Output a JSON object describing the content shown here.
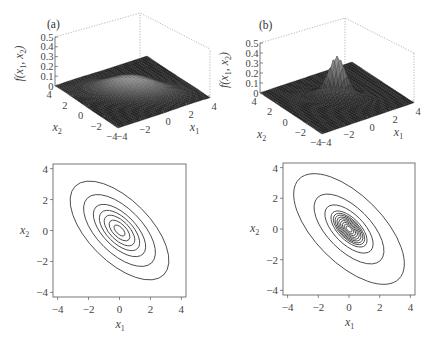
{
  "chart_data": [
    {
      "panel": "(a)",
      "type": "surface3d",
      "title": "",
      "zlabel": "f(x1, x2)",
      "xlabel": "x1",
      "ylabel": "x2",
      "z_ticks": [
        "0",
        "0.1",
        "0.2",
        "0.3",
        "0.4",
        "0.5"
      ],
      "x1_ticks": [
        "-4",
        "-2",
        "0",
        "2",
        "4"
      ],
      "x2_ticks": [
        "4",
        "2",
        "0",
        "-2",
        "-4"
      ],
      "xlim": [
        -4,
        4
      ],
      "ylim": [
        -4,
        4
      ],
      "zlim": [
        0,
        0.5
      ],
      "peak_value": 0.16,
      "description": "Broad bivariate Gaussian with negative correlation"
    },
    {
      "panel": "(b)",
      "type": "surface3d",
      "title": "",
      "zlabel": "f(x1, x2)",
      "xlabel": "x1",
      "ylabel": "x2",
      "z_ticks": [
        "0",
        "0.1",
        "0.2",
        "0.3",
        "0.4",
        "0.5"
      ],
      "x1_ticks": [
        "-4",
        "-2",
        "0",
        "2",
        "4"
      ],
      "x2_ticks": [
        "4",
        "2",
        "0",
        "-2",
        "-4"
      ],
      "xlim": [
        -4,
        4
      ],
      "ylim": [
        -4,
        4
      ],
      "zlim": [
        0,
        0.5
      ],
      "peak_value": 0.42,
      "description": "Sharply peaked, heavy-tailed bivariate density with negative correlation"
    },
    {
      "panel": "(a) contour",
      "type": "contour",
      "xlabel": "x1",
      "ylabel": "x2",
      "x_ticks": [
        "-4",
        "-2",
        "0",
        "2",
        "4"
      ],
      "y_ticks": [
        "-4",
        "-2",
        "0",
        "2",
        "4"
      ],
      "xlim": [
        -4.3,
        4.3
      ],
      "ylim": [
        -4.3,
        4.3
      ],
      "contour_count": 7,
      "contour_semi_major": [
        0.45,
        0.85,
        1.25,
        1.65,
        2.15,
        2.95,
        4.05
      ],
      "contour_semi_minor": [
        0.22,
        0.42,
        0.62,
        0.82,
        1.05,
        1.45,
        2.0
      ],
      "orientation_deg": -45
    },
    {
      "panel": "(b) contour",
      "type": "contour",
      "xlabel": "x1",
      "ylabel": "x2",
      "x_ticks": [
        "-4",
        "-2",
        "0",
        "2",
        "4"
      ],
      "y_ticks": [
        "-4",
        "-2",
        "0",
        "2",
        "4"
      ],
      "xlim": [
        -4.3,
        4.3
      ],
      "ylim": [
        -4.3,
        4.3
      ],
      "contour_count": 12,
      "contour_semi_major": [
        0.25,
        0.4,
        0.55,
        0.7,
        0.85,
        1.0,
        1.15,
        1.3,
        1.5,
        2.0,
        2.9,
        4.6
      ],
      "contour_semi_minor": [
        0.13,
        0.2,
        0.27,
        0.34,
        0.41,
        0.48,
        0.55,
        0.62,
        0.72,
        0.97,
        1.4,
        2.2
      ],
      "orientation_deg": -45
    }
  ],
  "labels": {
    "panel_a": "(a)",
    "panel_b": "(b)",
    "f_label": "f(x",
    "x1": "x",
    "x2": "x",
    "sub1": "1",
    "sub2": "2"
  }
}
